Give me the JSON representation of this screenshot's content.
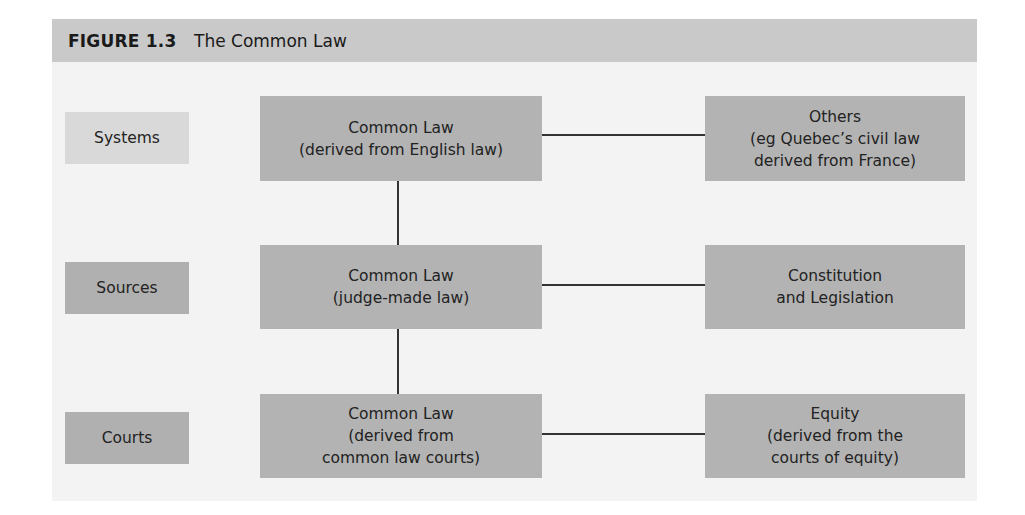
{
  "figure": {
    "number": "FIGURE 1.3",
    "title": "The Common Law"
  },
  "rows": [
    {
      "label": "Systems",
      "main": "Common Law\n(derived from English law)",
      "side": "Others\n(eg Quebec’s civil law\nderived from France)"
    },
    {
      "label": "Sources",
      "main": "Common Law\n(judge-made law)",
      "side": "Constitution\nand Legislation"
    },
    {
      "label": "Courts",
      "main": "Common Law\n(derived from\ncommon law courts)",
      "side": "Equity\n(derived from the\ncourts of equity)"
    }
  ],
  "colors": {
    "header_bg": "#c9c9c9",
    "panel_bg": "#f3f3f3",
    "label_light": "#d9d9d9",
    "box_fill": "#b3b3b3",
    "line": "#333333"
  }
}
